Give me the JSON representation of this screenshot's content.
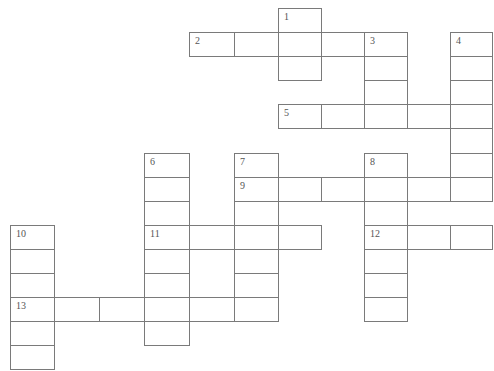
{
  "puzzle": {
    "cell_width": 44,
    "cell_height": 24,
    "col_x": [
      10,
      54,
      99,
      144,
      189,
      234,
      278,
      321,
      364,
      407,
      450
    ],
    "row_y": [
      8,
      32,
      56,
      80,
      104,
      128,
      153,
      177,
      201,
      225,
      249,
      273,
      297,
      321,
      345
    ],
    "line_color": "#7a7a7a",
    "number_color": "#555555",
    "words": [
      {
        "number": "1",
        "direction": "down",
        "col": 6,
        "row": 0,
        "length": 3
      },
      {
        "number": "2",
        "direction": "across",
        "col": 4,
        "row": 1,
        "length": 5
      },
      {
        "number": "3",
        "direction": "down",
        "col": 8,
        "row": 1,
        "length": 4
      },
      {
        "number": "4",
        "direction": "down",
        "col": 10,
        "row": 1,
        "length": 7
      },
      {
        "number": "5",
        "direction": "across",
        "col": 6,
        "row": 4,
        "length": 5
      },
      {
        "number": "6",
        "direction": "down",
        "col": 3,
        "row": 6,
        "length": 8
      },
      {
        "number": "7",
        "direction": "down",
        "col": 5,
        "row": 6,
        "length": 7
      },
      {
        "number": "8",
        "direction": "down",
        "col": 8,
        "row": 6,
        "length": 7
      },
      {
        "number": "9",
        "direction": "across",
        "col": 5,
        "row": 7,
        "length": 6
      },
      {
        "number": "10",
        "direction": "down",
        "col": 0,
        "row": 9,
        "length": 6
      },
      {
        "number": "11",
        "direction": "across",
        "col": 3,
        "row": 9,
        "length": 4
      },
      {
        "number": "12",
        "direction": "across",
        "col": 8,
        "row": 9,
        "length": 3
      },
      {
        "number": "13",
        "direction": "across",
        "col": 0,
        "row": 12,
        "length": 6
      }
    ]
  }
}
